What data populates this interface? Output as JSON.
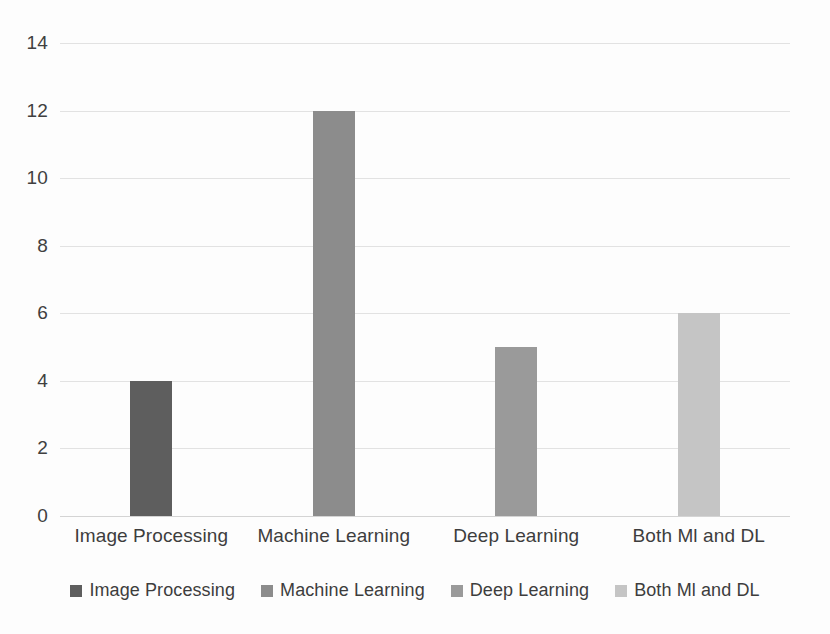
{
  "chart_data": {
    "type": "bar",
    "title": "",
    "subtitle": "",
    "xlabel": "",
    "ylabel": "",
    "ylim": [
      0,
      14
    ],
    "y_ticks": [
      0,
      2,
      4,
      6,
      8,
      10,
      12,
      14
    ],
    "y_tick_labels": [
      "0",
      "2",
      "4",
      "6",
      "8",
      "10",
      "12",
      "14"
    ],
    "grid": true,
    "legend_position": "bottom",
    "categories": [
      "Image Processing",
      "Machine Learning",
      "Deep Learning",
      "Both Ml and DL"
    ],
    "values": [
      4,
      12,
      5,
      6
    ],
    "series": [
      {
        "name": "Image Processing",
        "values": [
          4,
          null,
          null,
          null
        ],
        "color": "#5e5e5e"
      },
      {
        "name": "Machine Learning",
        "values": [
          null,
          12,
          null,
          null
        ],
        "color": "#8c8c8c"
      },
      {
        "name": "Deep Learning",
        "values": [
          null,
          null,
          5,
          null
        ],
        "color": "#9a9a9a"
      },
      {
        "name": "Both Ml and DL",
        "values": [
          null,
          null,
          null,
          6
        ],
        "color": "#c5c5c5"
      }
    ],
    "bars": [
      {
        "category": "Image Processing",
        "value": 4,
        "color": "#5e5e5e"
      },
      {
        "category": "Machine Learning",
        "value": 12,
        "color": "#8c8c8c"
      },
      {
        "category": "Deep Learning",
        "value": 5,
        "color": "#9a9a9a"
      },
      {
        "category": "Both Ml and DL",
        "value": 6,
        "color": "#c5c5c5"
      }
    ],
    "legend": [
      {
        "label": "Image Processing",
        "color": "#5e5e5e"
      },
      {
        "label": "Machine Learning",
        "color": "#8c8c8c"
      },
      {
        "label": "Deep Learning",
        "color": "#9a9a9a"
      },
      {
        "label": "Both Ml and DL",
        "color": "#c5c5c5"
      }
    ],
    "colors": {
      "gridline": "#e2e2e2",
      "baseline": "#d4d4d4",
      "text": "#3d3d3d",
      "background": "#fdfdfd"
    }
  }
}
